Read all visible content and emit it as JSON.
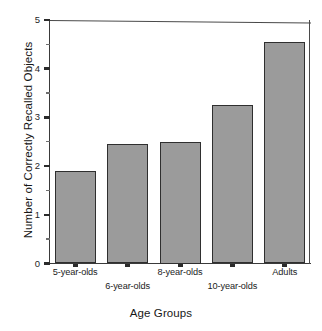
{
  "chart_data": {
    "type": "bar",
    "title": "",
    "xlabel": "Age Groups",
    "ylabel": "Number of Correctly Recalled Objects",
    "categories": [
      "5-year-olds",
      "6-year-olds",
      "8-year-olds",
      "10-year-olds",
      "Adults"
    ],
    "values": [
      1.9,
      2.45,
      2.5,
      3.25,
      4.55
    ],
    "ylim": [
      0,
      5
    ],
    "yticks": [
      0,
      1,
      2,
      3,
      4,
      5
    ],
    "ytick_labels": [
      "0",
      "1",
      "2",
      "3",
      "4",
      "5"
    ],
    "yminor_ticks": [
      0.5,
      1.5,
      2.5,
      3.5,
      4.5
    ],
    "grid": false,
    "legend": null,
    "bar_color": "#9b9b9b",
    "bar_edge_color": "#2f2f2f",
    "axis_color": "#3a3a3a",
    "label_rows": [
      0,
      1,
      0,
      1,
      0
    ]
  }
}
